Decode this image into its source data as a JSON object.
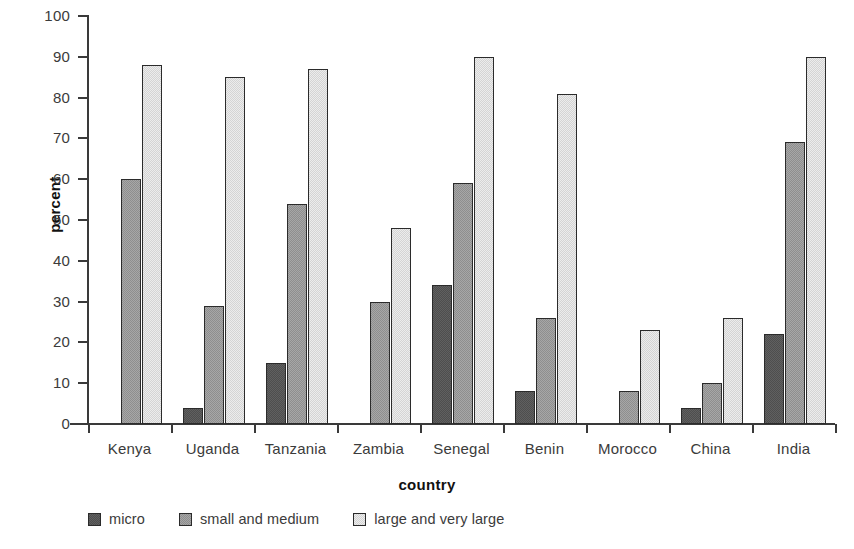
{
  "chart_data": {
    "type": "bar",
    "title": "",
    "subtitle": "",
    "xlabel": "country",
    "ylabel": "percent",
    "ylim": [
      0,
      100
    ],
    "ytick_step": 10,
    "yticks": [
      100,
      90,
      80,
      70,
      60,
      50,
      40,
      30,
      20,
      10,
      0
    ],
    "grid": false,
    "legend_position": "bottom-left",
    "categories": [
      "Kenya",
      "Uganda",
      "Tanzania",
      "Zambia",
      "Senegal",
      "Benin",
      "Morocco",
      "China",
      "India"
    ],
    "series": [
      {
        "name": "micro",
        "color": "#4e4e4e",
        "values": [
          null,
          4,
          15,
          null,
          34,
          8,
          null,
          4,
          22
        ]
      },
      {
        "name": "small and medium",
        "color": "#8e8e8e",
        "values": [
          60,
          29,
          54,
          30,
          59,
          26,
          8,
          10,
          69
        ]
      },
      {
        "name": "large and very large",
        "color": "#d4d4d4",
        "values": [
          88,
          85,
          87,
          48,
          90,
          81,
          23,
          26,
          90
        ]
      }
    ]
  },
  "legend": {
    "items": [
      {
        "label": "micro",
        "swatch": "#4e4e4e"
      },
      {
        "label": "small and medium",
        "swatch": "#8e8e8e"
      },
      {
        "label": "large and very large",
        "swatch": "#d4d4d4"
      }
    ]
  },
  "axis": {
    "y_title": "percent",
    "x_title": "country"
  },
  "colors": {
    "axis": "#3a3a3a",
    "text": "#3b3b3b",
    "title_text": "#111111",
    "background": "#ffffff",
    "bar_outline": "#2b2b2b"
  }
}
